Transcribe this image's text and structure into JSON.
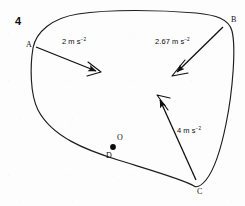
{
  "figure": {
    "question_number": "4",
    "type": "closed-curve-with-acceleration-vectors",
    "stroke_color": "#1a1a1a",
    "background_color": "#fdfdfd",
    "points": [
      {
        "id": "A",
        "label": "A",
        "x": 33,
        "y": 48,
        "marker": "none"
      },
      {
        "id": "B",
        "label": "B",
        "x": 229,
        "y": 22,
        "marker": "none"
      },
      {
        "id": "C",
        "label": "C",
        "x": 199,
        "y": 190,
        "marker": "none"
      },
      {
        "id": "D",
        "label": "D",
        "x": 110,
        "y": 153,
        "marker": "dot"
      },
      {
        "id": "O",
        "label": "O",
        "x": 119,
        "y": 139,
        "marker": "none"
      }
    ],
    "vectors": [
      {
        "id": "vector-a",
        "from": "A",
        "magnitude": "2",
        "unit": "m s",
        "exponent": "−2",
        "label": "2 m s⁻²",
        "label_x": 62,
        "label_y": 41,
        "x1": 36,
        "y1": 47,
        "x2": 98,
        "y2": 72
      },
      {
        "id": "vector-b",
        "from": "B",
        "magnitude": "2.67",
        "unit": "m s",
        "exponent": "−2",
        "label": "2.67 m s⁻²",
        "label_x": 156,
        "label_y": 40,
        "x1": 222,
        "y1": 27,
        "x2": 175,
        "y2": 74
      },
      {
        "id": "vector-c",
        "from": "C",
        "magnitude": "4",
        "unit": "m s",
        "exponent": "−2",
        "label": "4 m s⁻²",
        "label_x": 178,
        "label_y": 128,
        "x1": 196,
        "y1": 180,
        "x2": 158,
        "y2": 98
      }
    ]
  }
}
